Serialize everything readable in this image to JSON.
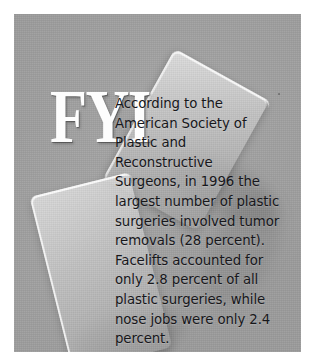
{
  "panel": {
    "background_color": "#9b9b9b",
    "page_background_color": "#ffffff",
    "card_highlight_color": "#ffffff",
    "body_text_color": "#17171b",
    "logo_color": "#fdfdfd"
  },
  "fyi": {
    "logo_text": "FYI",
    "body_text": "According to the American Society of Plastic and Reconstructive Surgeons, in 1996 the largest number of plastic surgeries involved tumor removals (28 percent). Facelifts accounted for only 2.8 percent of all plastic surgeries, while nose jobs were only 2.4 percent.",
    "lines": [
      "According to the",
      "American Society of",
      "Plastic and",
      "Reconstructive Surgeons,",
      "in 1996 the largest",
      "number of plastic",
      "surgeries involved tumor",
      "removals (28 percent).",
      "Facelifts accounted for",
      "only 2.8 percent of all",
      "plastic surgeries, while",
      "nose jobs were only 2.4",
      "percent."
    ],
    "facts": {
      "year": "1996",
      "tumor_removals_percent": "28 percent",
      "facelifts_percent": "2.8 percent",
      "nose_jobs_percent": "2.4 percent",
      "source_organization": "American Society of Plastic and Reconstructive Surgeons"
    }
  }
}
